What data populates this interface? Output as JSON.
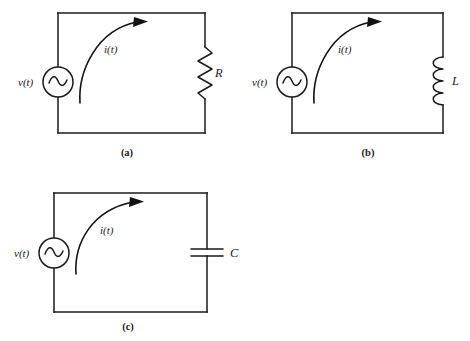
{
  "figure": {
    "background_color": "#ffffff",
    "line_color": "#1a1a1a"
  },
  "circuits": [
    {
      "id": "circuit-a",
      "caption": "(a)",
      "source_label": "v(t)",
      "source_symbol": "~",
      "current_label": "i(t)",
      "component_label": "R",
      "component_type": "resistor"
    },
    {
      "id": "circuit-b",
      "caption": "(b)",
      "source_label": "v(t)",
      "source_symbol": "~",
      "current_label": "i(t)",
      "component_label": "L",
      "component_type": "inductor"
    },
    {
      "id": "circuit-c",
      "caption": "(c)",
      "source_label": "v(t)",
      "source_symbol": "~",
      "current_label": "i(t)",
      "component_label": "C",
      "component_type": "capacitor"
    }
  ]
}
